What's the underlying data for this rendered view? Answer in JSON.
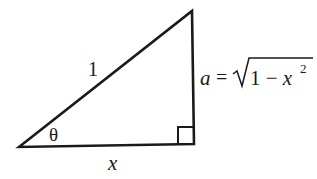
{
  "diagram": {
    "type": "right-triangle",
    "hypotenuse_label": "1",
    "angle_label": "θ",
    "adjacent_label": "x",
    "opposite_label_lhs": "a",
    "opposite_label_eq": "=",
    "opposite_radicand_1": "1 − x",
    "opposite_exponent": "2",
    "stroke_color": "#1a1a1a"
  }
}
